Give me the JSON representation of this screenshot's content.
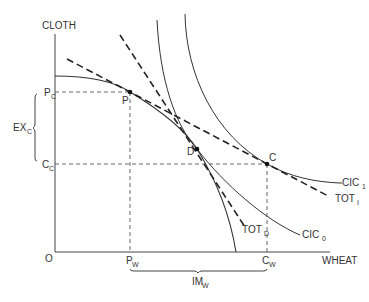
{
  "diagram": {
    "type": "trade-equilibrium",
    "axes": {
      "y_label": "CLOTH",
      "x_label": "WHEAT",
      "origin_label": "O"
    },
    "points": {
      "P": {
        "label": "P"
      },
      "D": {
        "label": "D"
      },
      "C": {
        "label": "C"
      }
    },
    "axis_markers": {
      "Pc": {
        "main": "P",
        "sub": "C"
      },
      "Cc": {
        "main": "C",
        "sub": "C"
      },
      "Pw": {
        "main": "P",
        "sub": "W"
      },
      "Cw": {
        "main": "C",
        "sub": "W"
      }
    },
    "brackets": {
      "exports": {
        "main": "EX",
        "sub": "C"
      },
      "imports": {
        "main": "IM",
        "sub": "W"
      }
    },
    "curves": {
      "cic1": {
        "main": "CIC",
        "sub": "1"
      },
      "cic0": {
        "main": "CIC",
        "sub": "0"
      },
      "tot_i": {
        "main": "TOT",
        "sub": "I"
      },
      "tot_d": {
        "main": "TOT",
        "sub": "D"
      }
    },
    "colors": {
      "line": "#333333",
      "background": "#ffffff"
    }
  }
}
